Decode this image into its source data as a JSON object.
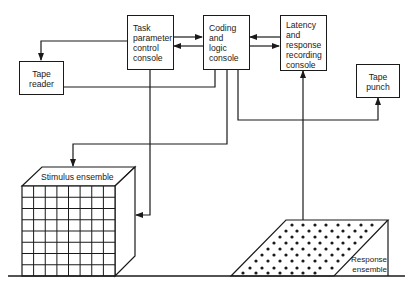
{
  "diagram": {
    "nodes": {
      "task_parameter": {
        "label": "Task\nparameter\ncontrol\nconsole"
      },
      "coding_logic": {
        "label": "Coding\nand\nlogic\nconsole"
      },
      "latency_recording": {
        "label": "Latency\nand\nresponse\nrecording\nconsole"
      },
      "tape_reader": {
        "label": "Tape\nreader"
      },
      "tape_punch": {
        "label": "Tape\npunch"
      },
      "stimulus_ensemble": {
        "label": "Stimulus ensemble",
        "grid_rows": 8,
        "grid_cols": 8
      },
      "response_ensemble": {
        "label": "Response\nensemble"
      }
    },
    "edges": [
      {
        "from": "task_parameter",
        "to": "coding_logic"
      },
      {
        "from": "coding_logic",
        "to": "task_parameter"
      },
      {
        "from": "latency_recording",
        "to": "coding_logic"
      },
      {
        "from": "coding_logic",
        "to": "latency_recording"
      },
      {
        "from": "task_parameter",
        "to": "tape_reader"
      },
      {
        "from": "tape_reader",
        "to": "coding_logic"
      },
      {
        "from": "coding_logic",
        "to": "stimulus_ensemble"
      },
      {
        "from": "task_parameter",
        "to": "stimulus_ensemble"
      },
      {
        "from": "coding_logic",
        "to": "tape_punch"
      },
      {
        "from": "response_ensemble",
        "to": "latency_recording"
      }
    ],
    "colors": {
      "line": "#1a1a1a",
      "background": "#ffffff"
    }
  }
}
